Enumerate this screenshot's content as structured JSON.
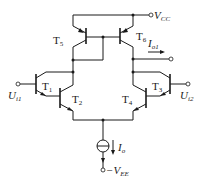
{
  "diagram": {
    "type": "circuit-schematic",
    "transistors": [
      {
        "id": "T1",
        "label": "T",
        "sub": "1",
        "type": "NPN"
      },
      {
        "id": "T2",
        "label": "T",
        "sub": "2",
        "type": "NPN"
      },
      {
        "id": "T3",
        "label": "T",
        "sub": "3",
        "type": "NPN"
      },
      {
        "id": "T4",
        "label": "T",
        "sub": "4",
        "type": "NPN"
      },
      {
        "id": "T5",
        "label": "T",
        "sub": "5",
        "type": "PNP"
      },
      {
        "id": "T6",
        "label": "T",
        "sub": "6",
        "type": "PNP"
      }
    ],
    "terminals": {
      "vcc": {
        "main": "V",
        "sub": "CC"
      },
      "vee": {
        "prefix": "−",
        "main": "V",
        "sub": "EE"
      },
      "ui1": {
        "main": "U",
        "sub": "i1"
      },
      "ui2": {
        "main": "U",
        "sub": "i2"
      }
    },
    "currents": {
      "io1": {
        "main": "I",
        "sub": "o1"
      },
      "io": {
        "main": "I",
        "sub": "o"
      }
    },
    "colors": {
      "line": "#1a1a1a",
      "background": "#ffffff"
    }
  }
}
